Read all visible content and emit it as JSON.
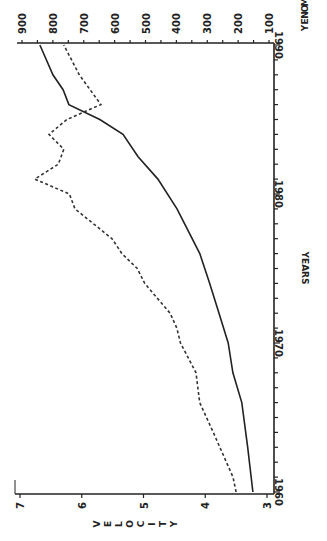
{
  "chart_data": {
    "type": "line",
    "orientation": "rotated 90 degrees clockwise (years run upward along the right edge)",
    "title": "",
    "xlabel": "YEARS",
    "ylabel_left": "VELOCITY",
    "ylabel_right": "MONEY",
    "x_range": [
      1960,
      1990
    ],
    "x_ticks": [
      1960,
      1970,
      1980,
      1990
    ],
    "velocity_range": [
      3,
      7
    ],
    "velocity_ticks": [
      3,
      4,
      5,
      6,
      7
    ],
    "money_range": [
      100,
      900
    ],
    "money_ticks": [
      100,
      200,
      300,
      400,
      500,
      600,
      700,
      800,
      900
    ],
    "grid": false,
    "legend": "none",
    "series": [
      {
        "name": "MONEY",
        "style": "solid",
        "axis": "MONEY",
        "x": [
          1960,
          1963,
          1966,
          1968,
          1970,
          1972,
          1974,
          1976,
          1979,
          1981,
          1982.5,
          1984,
          1985,
          1986,
          1987,
          1988,
          1990
        ],
        "values": [
          152,
          169,
          188,
          217,
          232,
          262,
          292,
          324,
          398,
          460,
          524,
          573,
          648,
          748,
          767,
          800,
          842
        ]
      },
      {
        "name": "VELOCITY",
        "style": "dashed",
        "axis": "VELOCITY",
        "x": [
          1960,
          1961,
          1964,
          1966,
          1968,
          1970,
          1971,
          1972,
          1974,
          1975,
          1976,
          1977,
          1979,
          1980,
          1981,
          1982,
          1983,
          1984,
          1985,
          1986,
          1988,
          1990
        ],
        "values": [
          3.5,
          3.55,
          3.87,
          4.09,
          4.15,
          4.4,
          4.46,
          4.57,
          4.98,
          5.1,
          5.35,
          5.51,
          6.11,
          6.2,
          6.76,
          6.38,
          6.29,
          6.53,
          6.24,
          5.69,
          6.04,
          6.29
        ]
      }
    ]
  },
  "labels": {
    "years_title": "YEARS",
    "velocity_title": [
      "V",
      "E",
      "L",
      "O",
      "C",
      "I",
      "T",
      "Y"
    ],
    "money_title": [
      "M",
      "O",
      "N",
      "E",
      "Y"
    ],
    "year_ticks": [
      "1960",
      "1970",
      "1980",
      "1990"
    ],
    "velocity_ticks": [
      "7",
      "6",
      "5",
      "4",
      "3"
    ],
    "money_ticks": [
      "900",
      "800",
      "700",
      "600",
      "500",
      "400",
      "300",
      "200",
      "100"
    ]
  }
}
